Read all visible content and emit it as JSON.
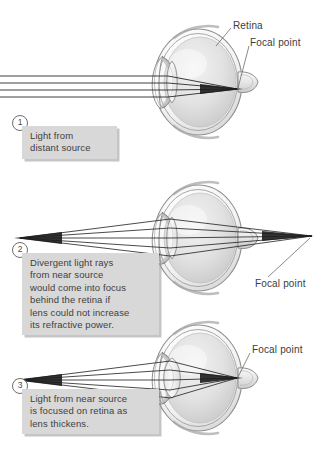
{
  "figure": {
    "background_color": "#ffffff",
    "callout_fill": "#d8d8d8",
    "text_color": "#3c3c3c",
    "ray_color": "#1d1d1d"
  },
  "panels": [
    {
      "id": "panel-1",
      "step": "1",
      "caption": "Light from\ndistant source",
      "labels": {
        "retina": "Retina",
        "focal_point": "Focal point"
      },
      "rays": {
        "type": "parallel",
        "count": 4,
        "converges_at": "retina"
      }
    },
    {
      "id": "panel-2",
      "step": "2",
      "caption": "Divergent light rays\nfrom near source\nwould come into focus\nbehind the retina if\nlens could not increase\nits refractive power.",
      "labels": {
        "focal_point": "Focal point"
      },
      "rays": {
        "type": "divergent",
        "count": 4,
        "converges_at": "behind-retina"
      }
    },
    {
      "id": "panel-3",
      "step": "3",
      "caption": "Light from near source\nis focused on retina as\nlens thickens.",
      "labels": {
        "focal_point": "Focal point"
      },
      "rays": {
        "type": "divergent",
        "count": 4,
        "converges_at": "retina"
      }
    }
  ]
}
